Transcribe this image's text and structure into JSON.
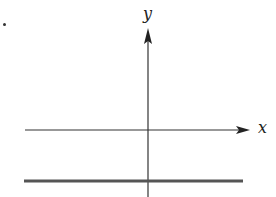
{
  "diagram": {
    "x_axis_label": "x",
    "y_axis_label": "y",
    "colors": {
      "axis": "#333333",
      "graph_line": "#555555",
      "background": "#ffffff"
    },
    "elements": [
      {
        "type": "axis",
        "name": "x-axis",
        "arrow": "right"
      },
      {
        "type": "axis",
        "name": "y-axis",
        "arrow": "up"
      },
      {
        "type": "line",
        "name": "horizontal-graph-line",
        "position": "below x-axis",
        "style": "thick"
      }
    ]
  }
}
